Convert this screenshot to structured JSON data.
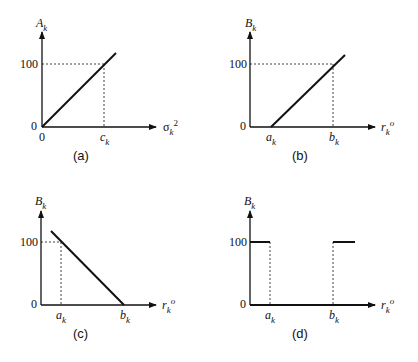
{
  "panels": [
    {
      "id": "a",
      "caption": "(a)",
      "y_label": "A",
      "y_label_sub": "k",
      "x_label": "σ",
      "x_label_sub": "k",
      "x_label_sup": "2",
      "y_ticks": [
        "100",
        "0"
      ],
      "x_ticks": [
        {
          "label": "0",
          "sub": ""
        },
        {
          "label": "c",
          "sub": "k"
        }
      ],
      "shape": "increasing line from origin"
    },
    {
      "id": "b",
      "caption": "(b)",
      "y_label": "B",
      "y_label_sub": "k",
      "x_label": "r",
      "x_label_sub": "k",
      "x_label_sup": "o",
      "y_ticks": [
        "100",
        "0"
      ],
      "x_ticks": [
        {
          "label": "a",
          "sub": "k"
        },
        {
          "label": "b",
          "sub": "k"
        }
      ],
      "shape": "increasing line from a_k"
    },
    {
      "id": "c",
      "caption": "(c)",
      "y_label": "B",
      "y_label_sub": "k",
      "x_label": "r",
      "x_label_sub": "k",
      "x_label_sup": "o",
      "y_ticks": [
        "100",
        "0"
      ],
      "x_ticks": [
        {
          "label": "a",
          "sub": "k"
        },
        {
          "label": "b",
          "sub": "k"
        }
      ],
      "shape": "decreasing line to b_k"
    },
    {
      "id": "d",
      "caption": "(d)",
      "y_label": "B",
      "y_label_sub": "k",
      "x_label": "r",
      "x_label_sub": "k",
      "x_label_sup": "o",
      "y_ticks": [
        "100",
        "0"
      ],
      "x_ticks": [
        {
          "label": "a",
          "sub": "k"
        },
        {
          "label": "b",
          "sub": "k"
        }
      ],
      "shape": "step: 100 below a_k, 0 between a_k and b_k, 100 above b_k"
    }
  ]
}
